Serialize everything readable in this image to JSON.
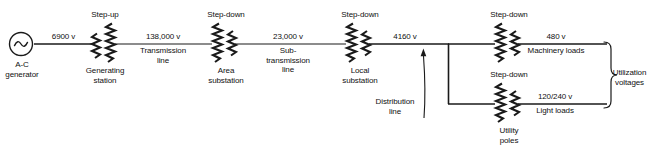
{
  "diagram": {
    "background_color": "#ffffff",
    "line_color": "#1a1a1a",
    "source": {
      "symbol": "ac-generator-circle-sine",
      "label": "A-C\ngenerator"
    },
    "stages": [
      {
        "id": "generating-station",
        "transformer_type": "Step-up",
        "type_label": "Step-up",
        "station_label": "Generating\nstation"
      },
      {
        "id": "area-substation",
        "transformer_type": "Step-down",
        "type_label": "Step-down",
        "station_label": "Area\nsubstation"
      },
      {
        "id": "local-substation",
        "transformer_type": "Step-down",
        "type_label": "Step-down",
        "station_label": "Local\nsubstation"
      },
      {
        "id": "machinery-transformer",
        "transformer_type": "Step-down",
        "type_label": "Step-down",
        "station_label": ""
      },
      {
        "id": "utility-poles",
        "transformer_type": "Step-down",
        "type_label": "Step-down",
        "station_label": "Utility\npoles"
      }
    ],
    "segments": [
      {
        "id": "generator-output",
        "voltage": "6900 v",
        "line_label": ""
      },
      {
        "id": "transmission-line",
        "voltage": "138,000 v",
        "line_label": "Transmission\nline"
      },
      {
        "id": "subtransmission-line",
        "voltage": "23,000 v",
        "line_label": "Sub-\ntransmission\nline"
      },
      {
        "id": "distribution-line",
        "voltage": "4160 v",
        "line_label": "Distribution\nline"
      },
      {
        "id": "machinery-branch",
        "voltage": "480 v",
        "line_label": "Machinery loads"
      },
      {
        "id": "lighting-branch",
        "voltage": "120/240 v",
        "line_label": "Light loads"
      }
    ],
    "brace": {
      "label": "Utilization\nvoltages"
    }
  }
}
